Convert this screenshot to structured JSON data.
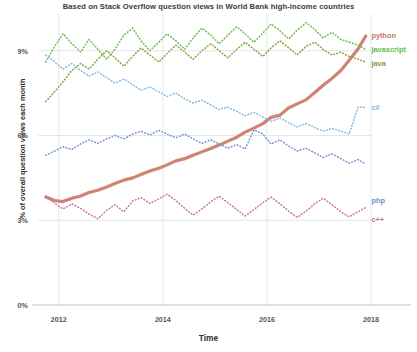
{
  "chart_data": {
    "type": "line",
    "title": "",
    "subtitle": "Based on Stack Overflow question views in World Bank high-income countries",
    "xlabel": "Time",
    "ylabel": "% of overall question views each month",
    "xlim": [
      2011.6,
      2018.0
    ],
    "ylim": [
      0,
      10.3
    ],
    "xticks": [
      "2012",
      "2014",
      "2016",
      "2018"
    ],
    "xtick_values": [
      2012,
      2014,
      2016,
      2018
    ],
    "yticks": [
      "0%",
      "3%",
      "6%",
      "9%"
    ],
    "ytick_values": [
      0,
      3,
      6,
      9
    ],
    "grid": true,
    "legend_position": "right-inline-annotations",
    "series": [
      {
        "name": "python",
        "color": "#cc7866",
        "style": "solid-thick",
        "label_x": 2017.95,
        "label_y": 9.55,
        "x": [
          2011.75,
          2011.92,
          2012.08,
          2012.25,
          2012.42,
          2012.58,
          2012.75,
          2012.92,
          2013.08,
          2013.25,
          2013.42,
          2013.58,
          2013.75,
          2013.92,
          2014.08,
          2014.25,
          2014.42,
          2014.58,
          2014.75,
          2014.92,
          2015.08,
          2015.25,
          2015.42,
          2015.58,
          2015.75,
          2015.92,
          2016.08,
          2016.25,
          2016.42,
          2016.58,
          2016.75,
          2016.92,
          2017.08,
          2017.25,
          2017.42,
          2017.58,
          2017.75,
          2017.9
        ],
        "y": [
          3.82,
          3.7,
          3.66,
          3.78,
          3.86,
          3.98,
          4.06,
          4.18,
          4.3,
          4.42,
          4.5,
          4.62,
          4.74,
          4.84,
          4.96,
          5.1,
          5.18,
          5.3,
          5.42,
          5.54,
          5.66,
          5.8,
          5.94,
          6.12,
          6.26,
          6.42,
          6.64,
          6.72,
          6.98,
          7.12,
          7.26,
          7.52,
          7.78,
          8.02,
          8.3,
          8.66,
          9.06,
          9.52
        ]
      },
      {
        "name": "javascript",
        "color": "#62bb46",
        "style": "dotted",
        "label_x": 2017.95,
        "label_y": 9.05,
        "x": [
          2011.75,
          2011.92,
          2012.08,
          2012.25,
          2012.42,
          2012.58,
          2012.75,
          2012.92,
          2013.08,
          2013.25,
          2013.42,
          2013.58,
          2013.75,
          2013.92,
          2014.08,
          2014.25,
          2014.42,
          2014.58,
          2014.75,
          2014.92,
          2015.08,
          2015.25,
          2015.42,
          2015.58,
          2015.75,
          2015.92,
          2016.08,
          2016.25,
          2016.42,
          2016.58,
          2016.75,
          2016.92,
          2017.08,
          2017.25,
          2017.42,
          2017.58,
          2017.75,
          2017.9
        ],
        "y": [
          8.6,
          9.15,
          9.6,
          9.25,
          8.95,
          9.4,
          9.05,
          8.7,
          9.05,
          9.55,
          9.8,
          9.35,
          9.0,
          9.3,
          9.6,
          9.35,
          9.05,
          9.45,
          9.8,
          9.55,
          9.25,
          9.55,
          9.85,
          9.6,
          9.3,
          9.62,
          9.95,
          9.7,
          9.42,
          9.72,
          10.0,
          9.75,
          9.45,
          9.65,
          9.4,
          9.3,
          9.2,
          9.05
        ]
      },
      {
        "name": "java",
        "color": "#8d9b3c",
        "style": "dotted",
        "label_x": 2017.95,
        "label_y": 8.55,
        "x": [
          2011.75,
          2011.92,
          2012.08,
          2012.25,
          2012.42,
          2012.58,
          2012.75,
          2012.92,
          2013.08,
          2013.25,
          2013.42,
          2013.58,
          2013.75,
          2013.92,
          2014.08,
          2014.25,
          2014.42,
          2014.58,
          2014.75,
          2014.92,
          2015.08,
          2015.25,
          2015.42,
          2015.58,
          2015.75,
          2015.92,
          2016.08,
          2016.25,
          2016.42,
          2016.58,
          2016.75,
          2016.92,
          2017.08,
          2017.25,
          2017.42,
          2017.58,
          2017.75,
          2017.9
        ],
        "y": [
          7.2,
          7.55,
          7.9,
          8.3,
          8.55,
          8.35,
          8.7,
          9.0,
          8.75,
          8.45,
          8.8,
          9.1,
          8.85,
          8.6,
          8.9,
          9.2,
          8.95,
          8.7,
          9.0,
          9.25,
          9.0,
          8.75,
          9.05,
          9.3,
          9.05,
          8.8,
          9.1,
          9.35,
          9.1,
          8.85,
          9.15,
          9.3,
          9.05,
          8.85,
          8.95,
          8.8,
          8.7,
          8.6
        ]
      },
      {
        "name": "c#",
        "color": "#7fb6e0",
        "style": "dotted",
        "label_x": 2017.95,
        "label_y": 7.0,
        "x": [
          2011.75,
          2011.92,
          2012.08,
          2012.25,
          2012.42,
          2012.58,
          2012.75,
          2012.92,
          2013.08,
          2013.25,
          2013.42,
          2013.58,
          2013.75,
          2013.92,
          2014.08,
          2014.25,
          2014.42,
          2014.58,
          2014.75,
          2014.92,
          2015.08,
          2015.25,
          2015.42,
          2015.58,
          2015.75,
          2015.92,
          2016.08,
          2016.25,
          2016.42,
          2016.58,
          2016.75,
          2016.92,
          2017.08,
          2017.25,
          2017.42,
          2017.58,
          2017.75,
          2017.9
        ],
        "y": [
          8.85,
          8.6,
          8.35,
          8.55,
          8.3,
          8.1,
          8.25,
          8.05,
          7.85,
          8.0,
          7.8,
          7.6,
          7.72,
          7.55,
          7.38,
          7.5,
          7.3,
          7.15,
          7.25,
          7.08,
          6.92,
          7.0,
          6.85,
          6.7,
          6.82,
          6.65,
          6.5,
          6.62,
          6.45,
          6.3,
          6.42,
          6.28,
          6.15,
          6.25,
          6.15,
          6.05,
          7.0,
          7.0
        ]
      },
      {
        "name": "php",
        "color": "#6f8fd0",
        "style": "dotted",
        "label_x": 2017.95,
        "label_y": 3.72,
        "x": [
          2011.75,
          2011.92,
          2012.08,
          2012.25,
          2012.42,
          2012.58,
          2012.75,
          2012.92,
          2013.08,
          2013.25,
          2013.42,
          2013.58,
          2013.75,
          2013.92,
          2014.08,
          2014.25,
          2014.42,
          2014.58,
          2014.75,
          2014.92,
          2015.08,
          2015.25,
          2015.42,
          2015.58,
          2015.75,
          2015.92,
          2016.08,
          2016.25,
          2016.42,
          2016.58,
          2016.75,
          2016.92,
          2017.08,
          2017.25,
          2017.42,
          2017.58,
          2017.75,
          2017.9
        ],
        "y": [
          5.3,
          5.45,
          5.6,
          5.5,
          5.7,
          5.85,
          5.72,
          5.88,
          6.0,
          5.88,
          6.05,
          6.15,
          6.02,
          6.18,
          6.05,
          5.92,
          6.05,
          5.88,
          5.72,
          5.85,
          5.7,
          5.55,
          5.68,
          5.52,
          6.2,
          6.05,
          5.7,
          5.85,
          5.62,
          5.45,
          5.55,
          5.38,
          5.22,
          5.35,
          5.18,
          5.02,
          5.15,
          4.98
        ]
      },
      {
        "name": "c++",
        "color": "#c46fa8",
        "style": "dotted",
        "label_x": 2017.95,
        "label_y": 3.05,
        "x": [
          2011.75,
          2011.92,
          2012.08,
          2012.25,
          2012.42,
          2012.58,
          2012.75,
          2012.92,
          2013.08,
          2013.25,
          2013.42,
          2013.58,
          2013.75,
          2013.92,
          2014.08,
          2014.25,
          2014.42,
          2014.58,
          2014.75,
          2014.92,
          2015.08,
          2015.25,
          2015.42,
          2015.58,
          2015.75,
          2015.92,
          2016.08,
          2016.25,
          2016.42,
          2016.58,
          2016.75,
          2016.92,
          2017.08,
          2017.25,
          2017.42,
          2017.58,
          2017.75,
          2017.9
        ],
        "y": [
          3.85,
          3.6,
          3.4,
          3.58,
          3.42,
          3.22,
          3.05,
          3.35,
          3.55,
          3.3,
          3.68,
          3.8,
          3.6,
          3.75,
          3.92,
          3.7,
          3.42,
          3.18,
          3.4,
          3.65,
          3.85,
          3.62,
          3.38,
          3.15,
          3.38,
          3.62,
          3.82,
          3.58,
          3.32,
          3.1,
          3.32,
          3.58,
          3.78,
          3.55,
          3.3,
          3.12,
          3.3,
          3.45
        ]
      }
    ]
  },
  "axis_color": "#b9c0c7",
  "grid_color": "#dfe3e8"
}
